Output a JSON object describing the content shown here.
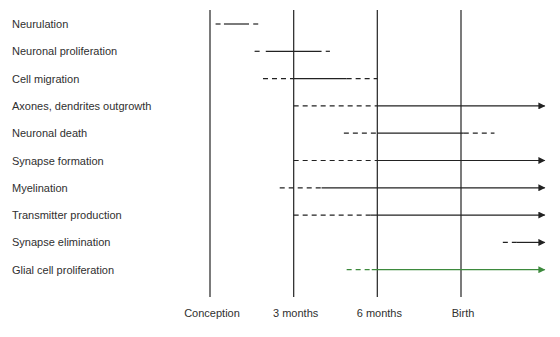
{
  "chart_data": {
    "type": "gantt-timeline",
    "title": "",
    "xlabel": "",
    "ylabel": "",
    "x_ticks": [
      {
        "label": "Conception",
        "value": 0
      },
      {
        "label": "3 months",
        "value": 3
      },
      {
        "label": "6 months",
        "value": 6
      },
      {
        "label": "Birth",
        "value": 9
      }
    ],
    "x_unit": "months after conception",
    "xlim": [
      -0.1,
      12.1
    ],
    "grid": "vertical lines at ticks",
    "legend": "none",
    "encoding": {
      "dashed": "tentative / onset or tapering period",
      "solid": "main period",
      "arrow": "continues after birth"
    },
    "rows": [
      {
        "label": "Neurulation",
        "color": "#222222",
        "segments": [
          {
            "style": "dashed",
            "start": 0.2,
            "end": 0.4
          },
          {
            "style": "solid",
            "start": 0.5,
            "end": 1.4
          },
          {
            "style": "dashed",
            "start": 1.55,
            "end": 1.75
          }
        ],
        "arrow": false
      },
      {
        "label": "Neuronal proliferation",
        "color": "#222222",
        "segments": [
          {
            "style": "dashed",
            "start": 1.6,
            "end": 1.9
          },
          {
            "style": "solid",
            "start": 2.0,
            "end": 4.0
          },
          {
            "style": "dashed",
            "start": 4.15,
            "end": 4.3
          }
        ],
        "arrow": false
      },
      {
        "label": "Cell migration",
        "color": "#222222",
        "segments": [
          {
            "style": "dashed",
            "start": 1.9,
            "end": 3.0
          },
          {
            "style": "solid",
            "start": 3.0,
            "end": 4.9
          },
          {
            "style": "dashed",
            "start": 4.9,
            "end": 6.0
          }
        ],
        "arrow": false
      },
      {
        "label": "Axones, dendrites outgrowth",
        "color": "#222222",
        "segments": [
          {
            "style": "dashed",
            "start": 3.0,
            "end": 6.0
          },
          {
            "style": "solid",
            "start": 6.0,
            "end": 12.0
          }
        ],
        "arrow": true
      },
      {
        "label": "Neuronal death",
        "color": "#222222",
        "segments": [
          {
            "style": "dashed",
            "start": 4.8,
            "end": 6.0
          },
          {
            "style": "solid",
            "start": 6.0,
            "end": 9.1
          },
          {
            "style": "dashed",
            "start": 9.1,
            "end": 10.2
          }
        ],
        "arrow": false
      },
      {
        "label": "Synapse formation",
        "color": "#222222",
        "segments": [
          {
            "style": "dashed",
            "start": 3.0,
            "end": 6.0
          },
          {
            "style": "solid",
            "start": 6.0,
            "end": 12.0
          }
        ],
        "arrow": true
      },
      {
        "label": "Myelination",
        "color": "#222222",
        "segments": [
          {
            "style": "dashed",
            "start": 2.5,
            "end": 4.0
          },
          {
            "style": "solid",
            "start": 4.0,
            "end": 12.0
          }
        ],
        "arrow": true
      },
      {
        "label": "Transmitter production",
        "color": "#222222",
        "segments": [
          {
            "style": "dashed",
            "start": 3.0,
            "end": 5.75
          },
          {
            "style": "solid",
            "start": 5.75,
            "end": 12.0
          }
        ],
        "arrow": true
      },
      {
        "label": "Synapse elimination",
        "color": "#222222",
        "segments": [
          {
            "style": "dashed",
            "start": 10.5,
            "end": 11.0
          },
          {
            "style": "solid",
            "start": 11.0,
            "end": 12.0
          }
        ],
        "arrow": true
      },
      {
        "label": "Glial cell proliferation",
        "color": "#3d8a3d",
        "segments": [
          {
            "style": "dashed",
            "start": 4.9,
            "end": 5.8
          },
          {
            "style": "solid",
            "start": 5.8,
            "end": 12.0
          }
        ],
        "arrow": true
      }
    ]
  }
}
